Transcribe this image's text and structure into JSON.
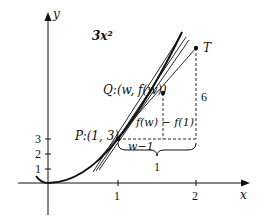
{
  "figure": {
    "function_label": "3x²",
    "axes": {
      "x_label": "x",
      "y_label": "y",
      "x_ticks": [
        "1",
        "2"
      ],
      "y_ticks": [
        "1",
        "2",
        "3"
      ]
    },
    "points": {
      "P": "P:(1, 3)",
      "Q": "Q:(w, f(w))",
      "T": "T"
    },
    "annotations": {
      "rise_label": "f(w) − f(1)",
      "run_label": "w−1",
      "brace_label": "1",
      "height_label": "6"
    },
    "colors": {
      "ink": "#111111",
      "background": "#ffffff"
    }
  }
}
